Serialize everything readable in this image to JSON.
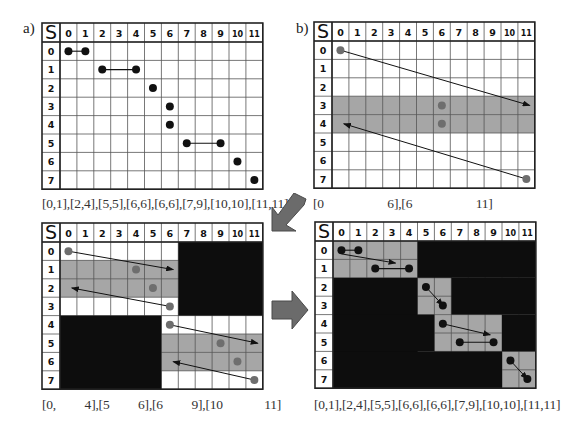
{
  "figure": {
    "grid": {
      "rows": 8,
      "cols": 12,
      "corner_label": "S",
      "row_labels": [
        "0",
        "1",
        "2",
        "3",
        "4",
        "5",
        "6",
        "7"
      ],
      "col_labels": [
        "0",
        "1",
        "2",
        "3",
        "4",
        "5",
        "6",
        "7",
        "8",
        "9",
        "10",
        "11"
      ]
    },
    "colors": {
      "band": "#a6a6a6",
      "mask": "#0d0d0d",
      "dot_black": "#111111",
      "dot_gray": "#6e6e6e",
      "grid_line": "#555555",
      "border": "#222222",
      "arrow_fill": "#6b6b6b"
    },
    "panels": [
      {
        "id": "a",
        "label": "a)",
        "caption": "[0,1],[2,4],[5,5],[6,6],[6,6],[7,9],[10,10],[11,11]",
        "bands": [],
        "masks": [],
        "dots": [
          [
            0,
            0,
            "black"
          ],
          [
            0,
            1,
            "black"
          ],
          [
            1,
            2,
            "black"
          ],
          [
            1,
            4,
            "black"
          ],
          [
            2,
            5,
            "black"
          ],
          [
            3,
            6,
            "black"
          ],
          [
            4,
            6,
            "black"
          ],
          [
            5,
            7,
            "black"
          ],
          [
            5,
            9,
            "black"
          ],
          [
            6,
            10,
            "black"
          ],
          [
            7,
            11,
            "black"
          ]
        ],
        "segments": [
          [
            0,
            0,
            0,
            1
          ],
          [
            1,
            2,
            1,
            4
          ],
          [
            5,
            7,
            5,
            9
          ]
        ],
        "arrows": []
      },
      {
        "id": "b",
        "label": "b)",
        "caption": "[0                    6],[6                    11]",
        "bands": [
          [
            3,
            0,
            3,
            11
          ],
          [
            4,
            0,
            4,
            11
          ]
        ],
        "masks": [],
        "dots": [
          [
            0,
            0,
            "gray"
          ],
          [
            3,
            6,
            "gray"
          ],
          [
            4,
            6,
            "gray"
          ],
          [
            7,
            11,
            "gray"
          ]
        ],
        "segments": [],
        "arrows": [
          [
            0,
            0,
            3,
            11.2
          ],
          [
            7,
            11,
            4,
            0.2
          ]
        ]
      },
      {
        "id": "c",
        "label": "",
        "caption": "[0,         4],[5         6],[6         9],[10             11]",
        "bands": [
          [
            1,
            0,
            1,
            6
          ],
          [
            2,
            0,
            2,
            6
          ],
          [
            5,
            6,
            5,
            11
          ],
          [
            6,
            6,
            6,
            11
          ]
        ],
        "masks": [
          [
            0,
            7,
            3,
            11
          ],
          [
            4,
            0,
            7,
            5
          ]
        ],
        "dots": [
          [
            0,
            0,
            "gray"
          ],
          [
            1,
            4,
            "gray"
          ],
          [
            2,
            5,
            "gray"
          ],
          [
            3,
            6,
            "gray"
          ],
          [
            4,
            6,
            "gray"
          ],
          [
            5,
            9,
            "gray"
          ],
          [
            6,
            10,
            "gray"
          ],
          [
            7,
            11,
            "gray"
          ]
        ],
        "segments": [],
        "arrows": [
          [
            0,
            0,
            1,
            6.2
          ],
          [
            3,
            6,
            2,
            0.2
          ],
          [
            4,
            6,
            5,
            11.2
          ],
          [
            7,
            11,
            6,
            6.2
          ]
        ]
      },
      {
        "id": "d",
        "label": "",
        "caption": "[0,1],[2,4],[5,5],[6,6],[6,6],[7,9],[10,10],[11,11]",
        "bands": [
          [
            0,
            0,
            1,
            4
          ],
          [
            2,
            5,
            3,
            6
          ],
          [
            4,
            6,
            5,
            9
          ],
          [
            6,
            10,
            7,
            11
          ]
        ],
        "masks": [
          [
            0,
            5,
            1,
            11
          ],
          [
            2,
            0,
            7,
            4
          ],
          [
            2,
            7,
            3,
            11
          ],
          [
            4,
            0,
            5,
            5
          ],
          [
            4,
            10,
            5,
            11
          ],
          [
            6,
            0,
            7,
            9
          ]
        ],
        "dots": [
          [
            0,
            0,
            "black"
          ],
          [
            0,
            1,
            "black"
          ],
          [
            1,
            2,
            "black"
          ],
          [
            1,
            4,
            "black"
          ],
          [
            2,
            5,
            "black"
          ],
          [
            3,
            6,
            "black"
          ],
          [
            4,
            6,
            "black"
          ],
          [
            5,
            7,
            "black"
          ],
          [
            5,
            9,
            "black"
          ],
          [
            6,
            10,
            "black"
          ],
          [
            7,
            11,
            "black"
          ]
        ],
        "segments": [
          [
            0,
            0,
            0,
            1
          ],
          [
            1,
            2,
            1,
            4
          ],
          [
            5,
            7,
            5,
            9
          ]
        ],
        "arrows": [
          [
            0.2,
            0,
            0.7,
            3.2
          ],
          [
            2,
            5,
            3,
            6
          ],
          [
            4,
            6,
            4.6,
            8.8
          ],
          [
            6,
            10,
            7,
            11
          ]
        ]
      }
    ],
    "transition_arrows": [
      {
        "id": "b-to-c",
        "direction": "down-left"
      },
      {
        "id": "c-to-d",
        "direction": "right"
      }
    ]
  }
}
